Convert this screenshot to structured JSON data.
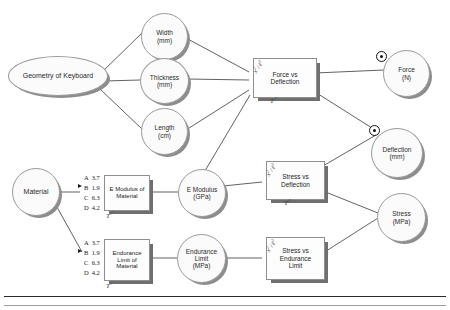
{
  "diagram": {
    "type": "engineering-analysis-flow",
    "background_color": "#ffffff",
    "line_color": "#3a3a3a",
    "node_fill": "#fbfbfb",
    "shadow_color": "#8d8d8d"
  },
  "inputs": [
    {
      "id": "geometry",
      "label_line1": "Geometry  of  Keyboard",
      "label_line2": "",
      "shape": "ellipse-wide"
    },
    {
      "id": "material",
      "label_line1": "Material",
      "label_line2": "",
      "shape": "ellipse"
    }
  ],
  "parameters": [
    {
      "id": "width",
      "label_line1": "Width",
      "label_line2": "(mm)"
    },
    {
      "id": "thickness",
      "label_line1": "Thickness",
      "label_line2": "(mm)"
    },
    {
      "id": "length",
      "label_line1": "Length",
      "label_line2": "(cm)"
    },
    {
      "id": "emodulus",
      "label_line1": "E Modulus",
      "label_line2": "(GPa)"
    },
    {
      "id": "endurance",
      "label_line1": "Endurance",
      "label_line2": "Limit",
      "label_line3": "(MPa)"
    }
  ],
  "outputs": [
    {
      "id": "force",
      "label_line1": "Force",
      "label_line2": "(N)",
      "has_target": true
    },
    {
      "id": "deflection",
      "label_line1": "Deflection",
      "label_line2": "(mm)",
      "has_target": true
    },
    {
      "id": "stress",
      "label_line1": "Stress",
      "label_line2": "(MPa)",
      "has_target": false
    }
  ],
  "models": [
    {
      "id": "force-vs-deflection",
      "line1": "Force vs",
      "line2": "Deflection",
      "line3": "",
      "equation": "x² / ℓ³",
      "tag": "T?"
    },
    {
      "id": "e-modulus-of-material",
      "line1": "E Modulus of",
      "line2": "Material",
      "line3": "",
      "equation": "",
      "tag": "T?"
    },
    {
      "id": "endurance-limit-of-material",
      "line1": "Endurance",
      "line2": "Limit  of",
      "line3": "Material",
      "equation": "",
      "tag": "T?"
    },
    {
      "id": "stress-vs-deflection",
      "line1": "Stress vs",
      "line2": "Deflection",
      "line3": "",
      "equation": "x² / ℓ³",
      "tag": "T?"
    },
    {
      "id": "stress-vs-endurance-limit",
      "line1": "Stress vs",
      "line2": "Endurance",
      "line3": "Limit",
      "equation": "x² / ℓ³",
      "tag": ""
    }
  ],
  "option_lists": [
    {
      "id": "e-modulus-options",
      "selected_key": "B",
      "options": [
        {
          "key": "A",
          "value": "3.7",
          "selected": false
        },
        {
          "key": "B",
          "value": "1.9",
          "selected": true
        },
        {
          "key": "C",
          "value": "6.3",
          "selected": false
        },
        {
          "key": "D",
          "value": "4.2",
          "selected": false
        }
      ]
    },
    {
      "id": "endurance-limit-options",
      "selected_key": "B",
      "options": [
        {
          "key": "A",
          "value": "3.7",
          "selected": false
        },
        {
          "key": "B",
          "value": "1.9",
          "selected": true
        },
        {
          "key": "C",
          "value": "6.3",
          "selected": false
        },
        {
          "key": "D",
          "value": "4.2",
          "selected": false
        }
      ]
    }
  ],
  "equation_glyph": {
    "numerator": "x",
    "numerator_exp": "2",
    "denominator": "ℓ",
    "denominator_exp": "3",
    "tag_label": "T",
    "tag_exp": "?"
  }
}
